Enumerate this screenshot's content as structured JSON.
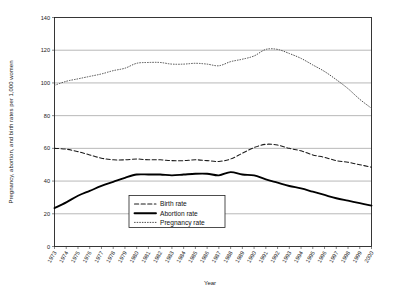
{
  "chart_data": {
    "type": "line",
    "title": "",
    "xlabel": "Year",
    "ylabel": "Pregnancy, abortion, and birth rates per 1,000 women",
    "ylim": [
      0,
      140
    ],
    "yticks": [
      0,
      20,
      40,
      60,
      80,
      100,
      120,
      140
    ],
    "ytick_labels": [
      "0",
      "20",
      "40",
      "60",
      "80",
      "100",
      "120",
      "140"
    ],
    "grid": true,
    "grid_axis": "y",
    "legend_position": "bottom-center-inside",
    "categories": [
      "1973",
      "1974",
      "1975",
      "1976",
      "1977",
      "1978",
      "1979",
      "1980",
      "1981",
      "1982",
      "1983",
      "1984",
      "1985",
      "1986",
      "1987",
      "1988",
      "1989",
      "1990",
      "1991",
      "1992",
      "1993",
      "1994",
      "1995",
      "1996",
      "1997",
      "1998",
      "1999",
      "2000"
    ],
    "xtick_labels": [
      "1973",
      "1974",
      "1975",
      "1976",
      "1977",
      "1978",
      "1979",
      "1980",
      "1981",
      "1982",
      "1983",
      "1984",
      "1985",
      "1986",
      "1987",
      "1988",
      "1989",
      "1990",
      "1991",
      "1992",
      "1993",
      "1994",
      "1995",
      "1996",
      "1997",
      "1998",
      "1999",
      "2000"
    ],
    "series": [
      {
        "name": "Birth rate",
        "style": "dashed",
        "values": [
          60,
          59.5,
          58,
          56,
          54,
          53,
          53,
          53.5,
          53,
          53,
          52.5,
          52.5,
          53,
          52.5,
          52,
          53.5,
          57,
          60.5,
          62.5,
          62,
          60,
          58.5,
          56,
          54.5,
          52.5,
          51.5,
          50,
          48.5
        ]
      },
      {
        "name": "Abortion rate",
        "style": "solid",
        "values": [
          23.5,
          27,
          31,
          34,
          37,
          39.5,
          42,
          44,
          44,
          44,
          43.5,
          44,
          44.5,
          44.5,
          43.5,
          45.5,
          44,
          43.5,
          41,
          39,
          37,
          35.5,
          33.5,
          31.5,
          29.5,
          28,
          26.5,
          25
        ]
      },
      {
        "name": "Pregnancy rate",
        "style": "dotted",
        "values": [
          98.5,
          101,
          102.5,
          104,
          105.5,
          107.5,
          109,
          112,
          112.5,
          112.5,
          111.5,
          111.5,
          112,
          111.5,
          110.5,
          113,
          114.5,
          116.5,
          120.5,
          120.5,
          118,
          115,
          111,
          107,
          102,
          96.5,
          90,
          84.5
        ]
      }
    ],
    "legend_entries": [
      {
        "label": "Birth rate",
        "style": "dashed"
      },
      {
        "label": "Abortion rate",
        "style": "solid"
      },
      {
        "label": "Pregnancy rate",
        "style": "dotted"
      }
    ]
  }
}
